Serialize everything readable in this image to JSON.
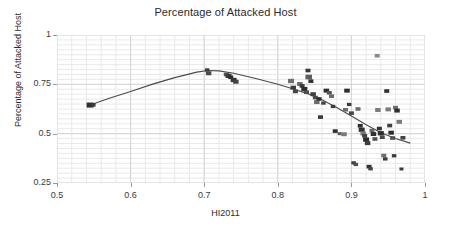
{
  "chart_data": {
    "type": "scatter",
    "title": "Percentage of Attacked Host",
    "xlabel": "HI2011",
    "ylabel": "Percentage of Attacked Host",
    "xlim": [
      0.5,
      1.0
    ],
    "ylim": [
      0.25,
      1.0
    ],
    "xticks": [
      "0.5",
      "0.6",
      "0.7",
      "0.8",
      "0.9",
      "1"
    ],
    "xtick_values": [
      0.5,
      0.6,
      0.7,
      0.8,
      0.9,
      1.0
    ],
    "yticks": [
      "0.25",
      "0.5",
      "0.75",
      "1"
    ],
    "ytick_values": [
      0.25,
      0.5,
      0.75,
      1.0
    ],
    "grid": true,
    "minor_grid": true,
    "legend": "none",
    "marker_color": "#2f2f2f",
    "marker_color_light": "#7d7d7d",
    "fit_line_color": "#4a4a4a",
    "grid_color": "#e9e9e9",
    "major_grid_color": "#d6d6d6",
    "points": [
      {
        "x": 0.545,
        "y": 0.645,
        "s": 7.0,
        "c": "#2e2e2e"
      },
      {
        "x": 0.549,
        "y": 0.646,
        "s": 5.0,
        "c": "#3a3a3a"
      },
      {
        "x": 0.704,
        "y": 0.823,
        "s": 4.5,
        "c": "#3c3c3c"
      },
      {
        "x": 0.706,
        "y": 0.806,
        "s": 5.5,
        "c": "#4a4a4a"
      },
      {
        "x": 0.73,
        "y": 0.8,
        "s": 5.0,
        "c": "#555555"
      },
      {
        "x": 0.733,
        "y": 0.793,
        "s": 6.0,
        "c": "#3b3b3b"
      },
      {
        "x": 0.736,
        "y": 0.786,
        "s": 5.0,
        "c": "#2f2f2f"
      },
      {
        "x": 0.74,
        "y": 0.772,
        "s": 6.0,
        "c": "#353535"
      },
      {
        "x": 0.743,
        "y": 0.763,
        "s": 5.5,
        "c": "#444444"
      },
      {
        "x": 0.818,
        "y": 0.767,
        "s": 6.0,
        "c": "#6f6f6f"
      },
      {
        "x": 0.821,
        "y": 0.733,
        "s": 5.5,
        "c": "#3d3d3d"
      },
      {
        "x": 0.824,
        "y": 0.714,
        "s": 5.0,
        "c": "#474747"
      },
      {
        "x": 0.83,
        "y": 0.752,
        "s": 5.5,
        "c": "#6a6a6a"
      },
      {
        "x": 0.833,
        "y": 0.742,
        "s": 5.0,
        "c": "#3b3b3b"
      },
      {
        "x": 0.836,
        "y": 0.726,
        "s": 6.0,
        "c": "#2c2c2c"
      },
      {
        "x": 0.839,
        "y": 0.71,
        "s": 5.0,
        "c": "#4d4d4d"
      },
      {
        "x": 0.841,
        "y": 0.82,
        "s": 5.0,
        "c": "#3a3a3a"
      },
      {
        "x": 0.842,
        "y": 0.787,
        "s": 6.5,
        "c": "#5e5e5e"
      },
      {
        "x": 0.845,
        "y": 0.766,
        "s": 5.0,
        "c": "#333333"
      },
      {
        "x": 0.848,
        "y": 0.7,
        "s": 5.5,
        "c": "#3f3f3f"
      },
      {
        "x": 0.851,
        "y": 0.683,
        "s": 5.0,
        "c": "#4b4b4b"
      },
      {
        "x": 0.853,
        "y": 0.66,
        "s": 5.5,
        "c": "#6d6d6d"
      },
      {
        "x": 0.856,
        "y": 0.676,
        "s": 5.0,
        "c": "#2e2e2e"
      },
      {
        "x": 0.858,
        "y": 0.584,
        "s": 5.0,
        "c": "#3a3a3a"
      },
      {
        "x": 0.862,
        "y": 0.655,
        "s": 4.5,
        "c": "#444444"
      },
      {
        "x": 0.866,
        "y": 0.718,
        "s": 5.5,
        "c": "#2d2d2d"
      },
      {
        "x": 0.87,
        "y": 0.707,
        "s": 5.0,
        "c": "#555555"
      },
      {
        "x": 0.873,
        "y": 0.69,
        "s": 5.0,
        "c": "#6b6b6b"
      },
      {
        "x": 0.875,
        "y": 0.638,
        "s": 4.5,
        "c": "#3c3c3c"
      },
      {
        "x": 0.878,
        "y": 0.513,
        "s": 5.0,
        "c": "#2f2f2f"
      },
      {
        "x": 0.884,
        "y": 0.5,
        "s": 4.0,
        "c": "#5a5a5a"
      },
      {
        "x": 0.89,
        "y": 0.497,
        "s": 5.5,
        "c": "#787878"
      },
      {
        "x": 0.892,
        "y": 0.621,
        "s": 5.0,
        "c": "#6e6e6e"
      },
      {
        "x": 0.894,
        "y": 0.718,
        "s": 5.5,
        "c": "#2c2c2c"
      },
      {
        "x": 0.897,
        "y": 0.648,
        "s": 4.5,
        "c": "#3b3b3b"
      },
      {
        "x": 0.9,
        "y": 0.604,
        "s": 5.0,
        "c": "#484848"
      },
      {
        "x": 0.903,
        "y": 0.352,
        "s": 4.5,
        "c": "#3a3a3a"
      },
      {
        "x": 0.906,
        "y": 0.344,
        "s": 4.5,
        "c": "#4e4e4e"
      },
      {
        "x": 0.909,
        "y": 0.625,
        "s": 5.0,
        "c": "#6c6c6c"
      },
      {
        "x": 0.912,
        "y": 0.54,
        "s": 5.0,
        "c": "#2e2e2e"
      },
      {
        "x": 0.914,
        "y": 0.52,
        "s": 6.0,
        "c": "#333333"
      },
      {
        "x": 0.916,
        "y": 0.501,
        "s": 5.5,
        "c": "#7a7a7a"
      },
      {
        "x": 0.918,
        "y": 0.489,
        "s": 5.0,
        "c": "#414141"
      },
      {
        "x": 0.92,
        "y": 0.47,
        "s": 6.0,
        "c": "#2b2b2b"
      },
      {
        "x": 0.922,
        "y": 0.452,
        "s": 5.5,
        "c": "#3d3d3d"
      },
      {
        "x": 0.924,
        "y": 0.333,
        "s": 5.0,
        "c": "#303030"
      },
      {
        "x": 0.926,
        "y": 0.322,
        "s": 4.5,
        "c": "#454545"
      },
      {
        "x": 0.928,
        "y": 0.515,
        "s": 5.0,
        "c": "#6a6a6a"
      },
      {
        "x": 0.93,
        "y": 0.498,
        "s": 5.5,
        "c": "#2f2f2f"
      },
      {
        "x": 0.932,
        "y": 0.473,
        "s": 5.0,
        "c": "#525252"
      },
      {
        "x": 0.935,
        "y": 0.895,
        "s": 5.0,
        "c": "#8a8a8a"
      },
      {
        "x": 0.936,
        "y": 0.62,
        "s": 5.5,
        "c": "#7c7c7c"
      },
      {
        "x": 0.938,
        "y": 0.526,
        "s": 5.0,
        "c": "#343434"
      },
      {
        "x": 0.94,
        "y": 0.502,
        "s": 6.0,
        "c": "#2d2d2d"
      },
      {
        "x": 0.942,
        "y": 0.482,
        "s": 5.0,
        "c": "#4a4a4a"
      },
      {
        "x": 0.944,
        "y": 0.389,
        "s": 5.0,
        "c": "#6e6e6e"
      },
      {
        "x": 0.946,
        "y": 0.372,
        "s": 4.5,
        "c": "#3b3b3b"
      },
      {
        "x": 0.948,
        "y": 0.716,
        "s": 5.0,
        "c": "#303030"
      },
      {
        "x": 0.95,
        "y": 0.623,
        "s": 5.5,
        "c": "#7b7b7b"
      },
      {
        "x": 0.952,
        "y": 0.541,
        "s": 5.0,
        "c": "#414141"
      },
      {
        "x": 0.954,
        "y": 0.505,
        "s": 5.5,
        "c": "#2c2c2c"
      },
      {
        "x": 0.956,
        "y": 0.478,
        "s": 5.0,
        "c": "#505050"
      },
      {
        "x": 0.958,
        "y": 0.388,
        "s": 4.5,
        "c": "#3a3a3a"
      },
      {
        "x": 0.96,
        "y": 0.632,
        "s": 5.0,
        "c": "#6f6f6f"
      },
      {
        "x": 0.962,
        "y": 0.617,
        "s": 5.5,
        "c": "#2e2e2e"
      },
      {
        "x": 0.965,
        "y": 0.56,
        "s": 5.5,
        "c": "#797979"
      },
      {
        "x": 0.968,
        "y": 0.321,
        "s": 4.0,
        "c": "#3d3d3d"
      },
      {
        "x": 0.97,
        "y": 0.479,
        "s": 5.0,
        "c": "#444444"
      }
    ],
    "fit_curve": [
      {
        "x": 0.545,
        "y": 0.645
      },
      {
        "x": 0.57,
        "y": 0.678
      },
      {
        "x": 0.6,
        "y": 0.714
      },
      {
        "x": 0.63,
        "y": 0.751
      },
      {
        "x": 0.66,
        "y": 0.784
      },
      {
        "x": 0.69,
        "y": 0.812
      },
      {
        "x": 0.705,
        "y": 0.82
      },
      {
        "x": 0.72,
        "y": 0.818
      },
      {
        "x": 0.74,
        "y": 0.806
      },
      {
        "x": 0.77,
        "y": 0.78
      },
      {
        "x": 0.8,
        "y": 0.75
      },
      {
        "x": 0.82,
        "y": 0.728
      },
      {
        "x": 0.84,
        "y": 0.703
      },
      {
        "x": 0.86,
        "y": 0.672
      },
      {
        "x": 0.88,
        "y": 0.633
      },
      {
        "x": 0.9,
        "y": 0.59
      },
      {
        "x": 0.92,
        "y": 0.545
      },
      {
        "x": 0.94,
        "y": 0.505
      },
      {
        "x": 0.96,
        "y": 0.475
      },
      {
        "x": 0.98,
        "y": 0.452
      }
    ]
  }
}
